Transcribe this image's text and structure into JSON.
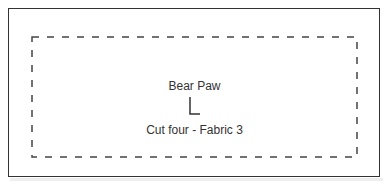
{
  "pattern_piece": {
    "name": "Bear Paw",
    "instruction": "Cut four - Fabric 3",
    "grainline_marker": "L-shaped grain/orientation mark"
  }
}
